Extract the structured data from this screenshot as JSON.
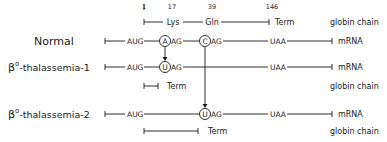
{
  "diagram": {
    "positions": [
      "1",
      "17",
      "39",
      "146"
    ],
    "header": {
      "codon17_aa": "Lys",
      "codon39_aa": "Gln",
      "stop": "Term",
      "chain_label": "globin chain"
    },
    "rows": [
      {
        "name": "Normal",
        "start": "AUG",
        "codon17": {
          "mut": "A",
          "rest": "AG"
        },
        "codon39": {
          "mut": "C",
          "rest": "AG"
        },
        "stop": "UAA",
        "mrna_label": "mRNA"
      },
      {
        "name_prefix": "β",
        "name_sup": "o",
        "name_suffix": "-thalassemia-1",
        "start": "AUG",
        "codon17": {
          "mut": "U",
          "rest": "AG"
        },
        "stop": "UAA",
        "mrna_label": "mRNA",
        "term_label": "Term",
        "chain_label": "globin chain"
      },
      {
        "name_prefix": "β",
        "name_sup": "o",
        "name_suffix": "-thalassemia-2",
        "start": "AUG",
        "codon39": {
          "mut": "U",
          "rest": "AG"
        },
        "stop": "UAA",
        "mrna_label": "mRNA",
        "term_label": "Term",
        "chain_label": "globin chain"
      }
    ]
  }
}
